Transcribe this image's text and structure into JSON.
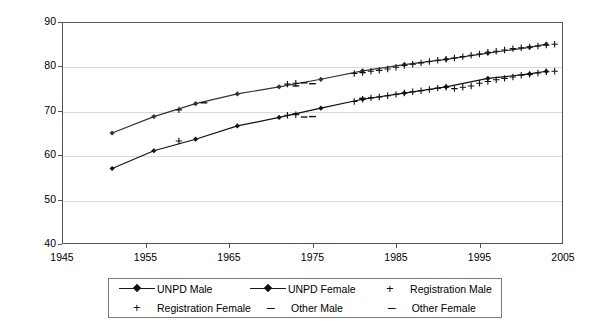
{
  "chart_data": {
    "type": "line",
    "title": "",
    "subtitle": "",
    "xlabel": "",
    "ylabel": "",
    "xlim": [
      1945,
      2005
    ],
    "ylim": [
      40,
      90
    ],
    "xticks": [
      1945,
      1955,
      1965,
      1975,
      1985,
      1995,
      2005
    ],
    "yticks": [
      40,
      50,
      60,
      70,
      80,
      90
    ],
    "grid": "horizontal",
    "legend_position": "bottom",
    "series": [
      {
        "name": "UNPD Male",
        "marker": "diamond",
        "line": true,
        "color": "#111111",
        "points": [
          [
            1951,
            57.0
          ],
          [
            1956,
            61.0
          ],
          [
            1961,
            63.6
          ],
          [
            1966,
            66.6
          ],
          [
            1971,
            68.5
          ],
          [
            1976,
            70.6
          ],
          [
            1981,
            72.6
          ],
          [
            1986,
            74.0
          ],
          [
            1991,
            75.4
          ],
          [
            1996,
            77.3
          ],
          [
            2001,
            78.3
          ],
          [
            2003,
            78.9
          ]
        ]
      },
      {
        "name": "UNPD Female",
        "marker": "diamond",
        "line": true,
        "color": "#333333",
        "points": [
          [
            1951,
            65.0
          ],
          [
            1956,
            68.7
          ],
          [
            1961,
            71.6
          ],
          [
            1966,
            73.8
          ],
          [
            1971,
            75.4
          ],
          [
            1976,
            77.1
          ],
          [
            1981,
            79.0
          ],
          [
            1986,
            80.4
          ],
          [
            1991,
            81.6
          ],
          [
            1996,
            83.0
          ],
          [
            2001,
            84.3
          ],
          [
            2003,
            85.0
          ]
        ]
      },
      {
        "name": "Registration Male",
        "marker": "plus",
        "line": false,
        "color": "#111111",
        "points": [
          [
            1959,
            63.2
          ],
          [
            1972,
            69.0
          ],
          [
            1973,
            69.1
          ],
          [
            1980,
            72.1
          ],
          [
            1981,
            72.6
          ],
          [
            1982,
            72.9
          ],
          [
            1983,
            73.1
          ],
          [
            1984,
            73.4
          ],
          [
            1985,
            73.7
          ],
          [
            1986,
            74.0
          ],
          [
            1987,
            74.3
          ],
          [
            1988,
            74.5
          ],
          [
            1989,
            74.8
          ],
          [
            1990,
            75.1
          ],
          [
            1991,
            75.3
          ],
          [
            1992,
            75.0
          ],
          [
            1993,
            75.3
          ],
          [
            1994,
            75.6
          ],
          [
            1995,
            76.2
          ],
          [
            1996,
            76.6
          ],
          [
            1997,
            77.0
          ],
          [
            1998,
            77.3
          ],
          [
            1999,
            77.6
          ],
          [
            2000,
            78.0
          ],
          [
            2001,
            78.2
          ],
          [
            2002,
            78.5
          ],
          [
            2003,
            78.8
          ],
          [
            2004,
            78.9
          ]
        ]
      },
      {
        "name": "Registration Female",
        "marker": "plus",
        "line": false,
        "color": "#111111",
        "points": [
          [
            1959,
            70.2
          ],
          [
            1972,
            76.0
          ],
          [
            1973,
            76.2
          ],
          [
            1980,
            78.4
          ],
          [
            1981,
            78.6
          ],
          [
            1982,
            78.9
          ],
          [
            1983,
            79.1
          ],
          [
            1984,
            79.4
          ],
          [
            1985,
            79.8
          ],
          [
            1986,
            80.2
          ],
          [
            1987,
            80.5
          ],
          [
            1988,
            80.8
          ],
          [
            1989,
            81.1
          ],
          [
            1990,
            81.4
          ],
          [
            1991,
            81.6
          ],
          [
            1992,
            81.9
          ],
          [
            1993,
            82.2
          ],
          [
            1994,
            82.5
          ],
          [
            1995,
            82.8
          ],
          [
            1996,
            83.2
          ],
          [
            1997,
            83.4
          ],
          [
            1998,
            83.7
          ],
          [
            1999,
            84.0
          ],
          [
            2000,
            84.2
          ],
          [
            2001,
            84.4
          ],
          [
            2002,
            84.6
          ],
          [
            2003,
            84.8
          ],
          [
            2004,
            85.0
          ]
        ]
      },
      {
        "name": "Other Male",
        "marker": "dash",
        "line": false,
        "color": "#111111",
        "points": [
          [
            1973,
            69.3
          ],
          [
            1974,
            68.6
          ],
          [
            1975,
            68.7
          ],
          [
            1981,
            72.8
          ]
        ]
      },
      {
        "name": "Other Female",
        "marker": "dash",
        "line": false,
        "color": "#111111",
        "points": [
          [
            1962,
            71.8
          ],
          [
            1973,
            75.6
          ],
          [
            1974,
            76.3
          ],
          [
            1975,
            76.1
          ]
        ]
      }
    ]
  },
  "axes": {
    "y_labels": [
      "90",
      "80",
      "70",
      "60",
      "50",
      "40"
    ],
    "x_labels": [
      "1945",
      "1955",
      "1965",
      "1975",
      "1985",
      "1995",
      "2005"
    ]
  },
  "legend": {
    "items": [
      {
        "label": "UNPD Male",
        "marker": "line-diamond"
      },
      {
        "label": "UNPD Female",
        "marker": "line-diamond"
      },
      {
        "label": "Registration Male",
        "marker": "plus"
      },
      {
        "label": "Registration Female",
        "marker": "plus"
      },
      {
        "label": "Other Male",
        "marker": "dash"
      },
      {
        "label": "Other Female",
        "marker": "dash"
      }
    ]
  }
}
